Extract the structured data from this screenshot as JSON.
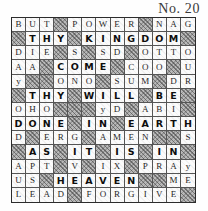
{
  "page": {
    "title": "No. 20",
    "kind": "crossword-puzzle",
    "colors": {
      "ink": "#262626",
      "shaded_fill": "#b9b9b9",
      "open_fill": "#fdfdfd",
      "border": "#2c2c2c"
    }
  },
  "grid": {
    "columns": 13,
    "rows": 13,
    "legend": {
      "shaded": "blocked square (hatched)",
      "bold": "bold answer letter",
      "plain": "light filler letter",
      "empty": "blank open square"
    },
    "cells": [
      [
        {
          "letter": "B",
          "style": "plain"
        },
        {
          "letter": "U",
          "style": "plain"
        },
        {
          "letter": "T",
          "style": "plain"
        },
        {
          "letter": "",
          "style": "shaded"
        },
        {
          "letter": "P",
          "style": "plain"
        },
        {
          "letter": "O",
          "style": "plain"
        },
        {
          "letter": "W",
          "style": "plain"
        },
        {
          "letter": "E",
          "style": "plain"
        },
        {
          "letter": "R",
          "style": "plain"
        },
        {
          "letter": "",
          "style": "shaded"
        },
        {
          "letter": "N",
          "style": "plain"
        },
        {
          "letter": "A",
          "style": "plain"
        },
        {
          "letter": "G",
          "style": "plain"
        }
      ],
      [
        {
          "letter": "",
          "style": "shaded"
        },
        {
          "letter": "T",
          "style": "bold"
        },
        {
          "letter": "H",
          "style": "bold"
        },
        {
          "letter": "Y",
          "style": "bold"
        },
        {
          "letter": "",
          "style": "shaded"
        },
        {
          "letter": "K",
          "style": "bold"
        },
        {
          "letter": "I",
          "style": "bold"
        },
        {
          "letter": "N",
          "style": "bold"
        },
        {
          "letter": "G",
          "style": "bold"
        },
        {
          "letter": "D",
          "style": "bold"
        },
        {
          "letter": "O",
          "style": "bold"
        },
        {
          "letter": "M",
          "style": "bold"
        },
        {
          "letter": "",
          "style": "shaded"
        }
      ],
      [
        {
          "letter": "D",
          "style": "plain"
        },
        {
          "letter": "I",
          "style": "plain"
        },
        {
          "letter": "E",
          "style": "plain"
        },
        {
          "letter": "",
          "style": "shaded"
        },
        {
          "letter": "S",
          "style": "plain"
        },
        {
          "letter": "",
          "style": "shaded"
        },
        {
          "letter": "S",
          "style": "plain"
        },
        {
          "letter": "D",
          "style": "plain"
        },
        {
          "letter": "",
          "style": "shaded"
        },
        {
          "letter": "O",
          "style": "plain"
        },
        {
          "letter": "T",
          "style": "plain"
        },
        {
          "letter": "T",
          "style": "plain"
        },
        {
          "letter": "O",
          "style": "plain"
        }
      ],
      [
        {
          "letter": "A",
          "style": "plain"
        },
        {
          "letter": "A",
          "style": "plain"
        },
        {
          "letter": "",
          "style": "shaded"
        },
        {
          "letter": "C",
          "style": "bold"
        },
        {
          "letter": "O",
          "style": "bold"
        },
        {
          "letter": "M",
          "style": "bold"
        },
        {
          "letter": "E",
          "style": "bold"
        },
        {
          "letter": "",
          "style": "shaded"
        },
        {
          "letter": "C",
          "style": "plain"
        },
        {
          "letter": "O",
          "style": "plain"
        },
        {
          "letter": "O",
          "style": "plain"
        },
        {
          "letter": "",
          "style": "shaded"
        },
        {
          "letter": "U",
          "style": "plain"
        }
      ],
      [
        {
          "letter": "y",
          "style": "plain"
        },
        {
          "letter": "",
          "style": "shaded"
        },
        {
          "letter": "",
          "style": "shaded"
        },
        {
          "letter": "O",
          "style": "plain"
        },
        {
          "letter": "N",
          "style": "plain"
        },
        {
          "letter": "O",
          "style": "plain"
        },
        {
          "letter": "",
          "style": "shaded"
        },
        {
          "letter": "S",
          "style": "plain"
        },
        {
          "letter": "U",
          "style": "plain"
        },
        {
          "letter": "M",
          "style": "plain"
        },
        {
          "letter": "",
          "style": "shaded"
        },
        {
          "letter": "D",
          "style": "plain"
        },
        {
          "letter": "R",
          "style": "plain"
        }
      ],
      [
        {
          "letter": "",
          "style": "shaded"
        },
        {
          "letter": "T",
          "style": "bold"
        },
        {
          "letter": "H",
          "style": "bold"
        },
        {
          "letter": "Y",
          "style": "bold"
        },
        {
          "letter": "",
          "style": "shaded"
        },
        {
          "letter": "W",
          "style": "bold"
        },
        {
          "letter": "I",
          "style": "bold"
        },
        {
          "letter": "L",
          "style": "bold"
        },
        {
          "letter": "L",
          "style": "bold"
        },
        {
          "letter": "",
          "style": "shaded"
        },
        {
          "letter": "B",
          "style": "bold"
        },
        {
          "letter": "E",
          "style": "bold"
        },
        {
          "letter": "",
          "style": "shaded"
        }
      ],
      [
        {
          "letter": "O",
          "style": "plain"
        },
        {
          "letter": "H",
          "style": "plain"
        },
        {
          "letter": "O",
          "style": "plain"
        },
        {
          "letter": "",
          "style": "shaded"
        },
        {
          "letter": "",
          "style": "shaded"
        },
        {
          "letter": "",
          "style": "shaded"
        },
        {
          "letter": "y",
          "style": "plain"
        },
        {
          "letter": "D",
          "style": "plain"
        },
        {
          "letter": "",
          "style": "shaded"
        },
        {
          "letter": "A",
          "style": "plain"
        },
        {
          "letter": "B",
          "style": "plain"
        },
        {
          "letter": "I",
          "style": "plain"
        },
        {
          "letter": "",
          "style": "shaded"
        }
      ],
      [
        {
          "letter": "D",
          "style": "bold"
        },
        {
          "letter": "O",
          "style": "bold"
        },
        {
          "letter": "N",
          "style": "bold"
        },
        {
          "letter": "E",
          "style": "bold"
        },
        {
          "letter": "",
          "style": "shaded"
        },
        {
          "letter": "I",
          "style": "bold"
        },
        {
          "letter": "N",
          "style": "bold"
        },
        {
          "letter": "",
          "style": "shaded"
        },
        {
          "letter": "E",
          "style": "bold"
        },
        {
          "letter": "A",
          "style": "bold"
        },
        {
          "letter": "R",
          "style": "bold"
        },
        {
          "letter": "T",
          "style": "bold"
        },
        {
          "letter": "H",
          "style": "bold"
        }
      ],
      [
        {
          "letter": "D",
          "style": "plain"
        },
        {
          "letter": "",
          "style": "shaded"
        },
        {
          "letter": "E",
          "style": "plain"
        },
        {
          "letter": "R",
          "style": "plain"
        },
        {
          "letter": "G",
          "style": "plain"
        },
        {
          "letter": "",
          "style": "shaded"
        },
        {
          "letter": "A",
          "style": "plain"
        },
        {
          "letter": "M",
          "style": "plain"
        },
        {
          "letter": "E",
          "style": "plain"
        },
        {
          "letter": "N",
          "style": "plain"
        },
        {
          "letter": "",
          "style": "shaded"
        },
        {
          "letter": "",
          "style": "shaded"
        },
        {
          "letter": "S",
          "style": "plain"
        }
      ],
      [
        {
          "letter": "",
          "style": "shaded"
        },
        {
          "letter": "A",
          "style": "bold"
        },
        {
          "letter": "S",
          "style": "bold"
        },
        {
          "letter": "",
          "style": "shaded"
        },
        {
          "letter": "I",
          "style": "bold"
        },
        {
          "letter": "T",
          "style": "bold"
        },
        {
          "letter": "",
          "style": "shaded"
        },
        {
          "letter": "I",
          "style": "bold"
        },
        {
          "letter": "S",
          "style": "bold"
        },
        {
          "letter": "",
          "style": "shaded"
        },
        {
          "letter": "I",
          "style": "bold"
        },
        {
          "letter": "N",
          "style": "bold"
        },
        {
          "letter": "",
          "style": "shaded"
        }
      ],
      [
        {
          "letter": "A",
          "style": "plain"
        },
        {
          "letter": "P",
          "style": "plain"
        },
        {
          "letter": "T",
          "style": "plain"
        },
        {
          "letter": "",
          "style": "shaded"
        },
        {
          "letter": "V",
          "style": "plain"
        },
        {
          "letter": "",
          "style": "shaded"
        },
        {
          "letter": "I",
          "style": "plain"
        },
        {
          "letter": "X",
          "style": "plain"
        },
        {
          "letter": "",
          "style": "shaded"
        },
        {
          "letter": "P",
          "style": "plain"
        },
        {
          "letter": "R",
          "style": "plain"
        },
        {
          "letter": "A",
          "style": "plain"
        },
        {
          "letter": "y",
          "style": "plain"
        }
      ],
      [
        {
          "letter": "U",
          "style": "plain"
        },
        {
          "letter": "S",
          "style": "plain"
        },
        {
          "letter": "",
          "style": "shaded"
        },
        {
          "letter": "H",
          "style": "bold"
        },
        {
          "letter": "E",
          "style": "bold"
        },
        {
          "letter": "A",
          "style": "bold"
        },
        {
          "letter": "V",
          "style": "bold"
        },
        {
          "letter": "E",
          "style": "bold"
        },
        {
          "letter": "N",
          "style": "bold"
        },
        {
          "letter": "",
          "style": "shaded"
        },
        {
          "letter": "",
          "style": "shaded"
        },
        {
          "letter": "M",
          "style": "plain"
        },
        {
          "letter": "E",
          "style": "plain"
        }
      ],
      [
        {
          "letter": "L",
          "style": "plain"
        },
        {
          "letter": "E",
          "style": "plain"
        },
        {
          "letter": "A",
          "style": "plain"
        },
        {
          "letter": "D",
          "style": "plain"
        },
        {
          "letter": "",
          "style": "shaded"
        },
        {
          "letter": "F",
          "style": "plain"
        },
        {
          "letter": "O",
          "style": "plain"
        },
        {
          "letter": "R",
          "style": "plain"
        },
        {
          "letter": "G",
          "style": "plain"
        },
        {
          "letter": "I",
          "style": "plain"
        },
        {
          "letter": "V",
          "style": "plain"
        },
        {
          "letter": "E",
          "style": "plain"
        },
        {
          "letter": "",
          "style": "shaded"
        }
      ]
    ]
  }
}
